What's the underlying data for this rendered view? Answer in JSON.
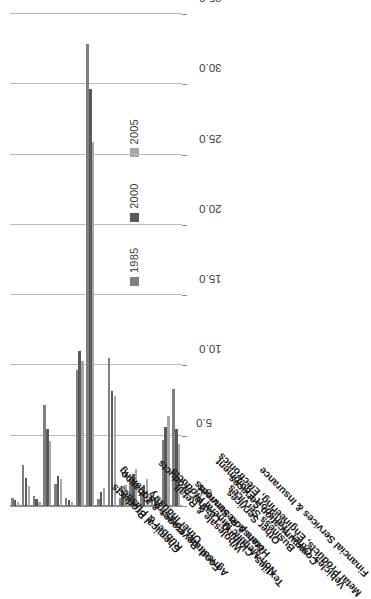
{
  "chart": {
    "type": "bar",
    "orientation": "vertical-rotated",
    "title": "",
    "xlabel": "",
    "ylabel": ""
  },
  "legend": {
    "position": "top-right",
    "entries": [
      {
        "label": "1985",
        "color": "#7f7f7f"
      },
      {
        "label": "2000",
        "color": "#595959"
      },
      {
        "label": "2005",
        "color": "#a6a6a6"
      }
    ]
  },
  "axis": {
    "ticks": [
      "0.0",
      "5.0",
      "10.0",
      "15.0",
      "20.0",
      "25.0",
      "30.0",
      "35.0"
    ],
    "min": 0.0,
    "max": 35.0,
    "step": 5.0
  },
  "chart_data": {
    "type": "bar",
    "title": "",
    "xlabel": "",
    "ylabel": "",
    "ylim": [
      0.0,
      35.0
    ],
    "grid": true,
    "legend_position": "top-right",
    "categories": [
      "Agriculture, Forestry & Fishing",
      "Food, Beverages & Tobacco",
      "Textiles, Clothing, Leather Products",
      "Chemical Products",
      "Rubber & Plastics",
      "Non-Metallic Mineral Products",
      "Metal Products, Engineering, Electronics",
      "Vehicles, Other Transport Equipment",
      "Other Industry",
      "Wholesale & Retail",
      "Hotels & Restaurants",
      "Transport Services",
      "Communication Services",
      "Financial Services & Insurance",
      "Business Services",
      "Other Services"
    ],
    "series": [
      {
        "name": "1985",
        "color": "#7f7f7f",
        "values": [
          0.6,
          2.9,
          0.7,
          7.2,
          1.6,
          0.6,
          9.7,
          32.9,
          0.5,
          10.5,
          0.6,
          1.8,
          1.0,
          0.5,
          4.7,
          8.3
        ]
      },
      {
        "name": "2000",
        "color": "#595959",
        "values": [
          0.4,
          2.0,
          0.5,
          5.5,
          2.1,
          0.4,
          11.0,
          29.7,
          1.0,
          8.2,
          1.1,
          2.3,
          1.5,
          0.6,
          5.6,
          5.5
        ]
      },
      {
        "name": "2005",
        "color": "#a6a6a6",
        "values": [
          0.3,
          1.4,
          0.3,
          4.6,
          1.9,
          0.3,
          10.3,
          25.9,
          1.3,
          7.8,
          1.5,
          2.6,
          1.9,
          0.7,
          6.4,
          4.4
        ]
      }
    ]
  }
}
